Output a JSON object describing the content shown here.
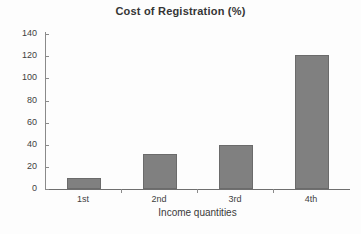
{
  "chart_data": {
    "type": "bar",
    "title": "Cost of Registration (%)",
    "xlabel": "Income quantities",
    "ylabel": "",
    "categories": [
      "1st",
      "2nd",
      "3rd",
      "4th"
    ],
    "values": [
      10,
      32,
      40,
      121
    ],
    "ylim": [
      0,
      140
    ],
    "ytick_step": 20,
    "yticks": [
      140,
      120,
      100,
      80,
      60,
      40,
      20,
      0
    ],
    "ytick_labels": [
      "140",
      "120",
      "100",
      "80",
      "60",
      "40",
      "20",
      "0"
    ],
    "grid": false,
    "legend": false,
    "legend_position": "none",
    "series": [
      {
        "name": "Cost of Registration (%)",
        "values": [
          10,
          32,
          40,
          121
        ]
      }
    ]
  },
  "style": {
    "bar_fill": "#808080",
    "bar_border": "#6b6b6b",
    "axis_color": "#8a8a8a",
    "text_color": "#3a3a3a",
    "background": "#fdfdfd"
  }
}
